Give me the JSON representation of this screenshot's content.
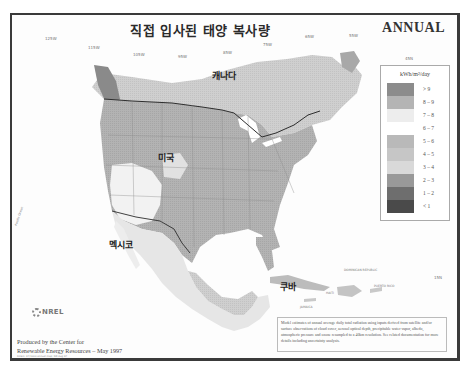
{
  "map": {
    "title": "직접 입사된 태양 복사량",
    "period_label": "ANNUAL",
    "longitude_labels": [
      "125W",
      "115W",
      "105W",
      "95W",
      "85W",
      "75W",
      "65W",
      "55W"
    ],
    "latitude_labels": [
      "45N",
      "35N",
      "25N",
      "15N"
    ],
    "country_labels": {
      "canada": "캐나다",
      "usa": "미국",
      "mexico": "멕시코",
      "cuba": "쿠바"
    },
    "caribbean_labels": {
      "dominican_republic": "DOMINICAN REPUBLIC",
      "puerto_rico": "PUERTO RICO",
      "haiti": "HAITI",
      "jamaica": "JAMAICA"
    },
    "side_label": "Pacific Ocean"
  },
  "legend": {
    "unit": "kWh/m²/day",
    "classes": [
      {
        "label": "> 9",
        "color": "#8c8c8c"
      },
      {
        "label": "8 – 9",
        "color": "#b4b4b4"
      },
      {
        "label": "7 – 8",
        "color": "#ededed"
      },
      {
        "label": "6 – 7",
        "color": "#ffffff"
      },
      {
        "label": "5 – 6",
        "color": "#b9b9b9"
      },
      {
        "label": "4 – 5",
        "color": "#c6c6c6"
      },
      {
        "label": "3 – 4",
        "color": "#d9d9d9"
      },
      {
        "label": "2 – 3",
        "color": "#999999"
      },
      {
        "label": "1 – 2",
        "color": "#6e6e6e"
      },
      {
        "label": "< 1",
        "color": "#4a4a4a"
      }
    ]
  },
  "footer": {
    "logo_text": "NREL",
    "producer_line1": "Produced by the Center for",
    "producer_line2": "Renewable Energy Resources – May 1997",
    "small_credit": "Direct: 47/1000 annual map; NR Aug 97",
    "note": "Model estimates of annual average daily total radiation using inputs derived from satellite and/or surface observations of cloud cover, aerosol optical depth, precipitable water vapor, albedo, atmospheric pressure and ozone resampled to a 40km resolution. See related documentation for more details including uncertainty analysis."
  }
}
